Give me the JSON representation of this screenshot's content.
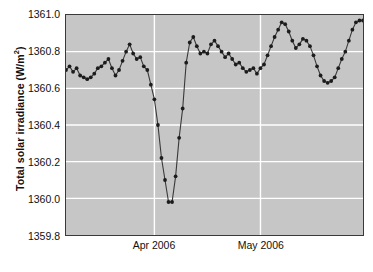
{
  "chart_data": {
    "type": "line",
    "title": "",
    "xlabel": "",
    "ylabel": "Total solar irradiance (W/m²)",
    "ylabel_text": "Total solar irradiance (W/m",
    "ylabel_sup": "2",
    "ylabel_tail": ")",
    "ylim": [
      1359.8,
      1361.0
    ],
    "ytick_values": [
      1361.0,
      1360.8,
      1360.6,
      1360.4,
      1360.2,
      1360.0,
      1359.8
    ],
    "ytick_labels": [
      "1361.0",
      "1360.8",
      "1360.6",
      "1360.4",
      "1360.2",
      "1360.0",
      "1359.8"
    ],
    "xlim_days": [
      0,
      84
    ],
    "xtick_days": [
      25,
      55
    ],
    "xtick_labels": [
      "Apr 2006",
      "May 2006"
    ],
    "grid": {
      "horizontal": true,
      "vertical": true,
      "color": "#ffffff"
    },
    "legend": null,
    "marker": "circle",
    "line_color": "#383838",
    "marker_color": "#1c1c1c",
    "plot_background": "#c6c6c6",
    "frame_color": "#3a3a3a",
    "x": [
      0,
      1,
      2,
      3,
      4,
      5,
      6,
      7,
      8,
      9,
      10,
      11,
      12,
      13,
      14,
      15,
      16,
      17,
      18,
      19,
      20,
      21,
      22,
      23,
      24,
      25,
      26,
      27,
      28,
      29,
      30,
      31,
      32,
      33,
      34,
      35,
      36,
      37,
      38,
      39,
      40,
      41,
      42,
      43,
      44,
      45,
      46,
      47,
      48,
      49,
      50,
      51,
      52,
      53,
      54,
      55,
      56,
      57,
      58,
      59,
      60,
      61,
      62,
      63,
      64,
      65,
      66,
      67,
      68,
      69,
      70,
      71,
      72,
      73,
      74,
      75,
      76,
      77,
      78,
      79,
      80,
      81,
      82,
      83,
      84
    ],
    "values": [
      1360.7,
      1360.72,
      1360.69,
      1360.71,
      1360.67,
      1360.66,
      1360.65,
      1360.66,
      1360.68,
      1360.71,
      1360.72,
      1360.74,
      1360.76,
      1360.71,
      1360.67,
      1360.7,
      1360.75,
      1360.8,
      1360.84,
      1360.79,
      1360.76,
      1360.77,
      1360.72,
      1360.7,
      1360.62,
      1360.54,
      1360.4,
      1360.22,
      1360.1,
      1359.98,
      1359.98,
      1360.12,
      1360.33,
      1360.49,
      1360.74,
      1360.85,
      1360.88,
      1360.83,
      1360.79,
      1360.8,
      1360.79,
      1360.84,
      1360.86,
      1360.83,
      1360.8,
      1360.77,
      1360.79,
      1360.76,
      1360.73,
      1360.74,
      1360.71,
      1360.69,
      1360.7,
      1360.71,
      1360.68,
      1360.71,
      1360.73,
      1360.78,
      1360.83,
      1360.88,
      1360.92,
      1360.96,
      1360.95,
      1360.91,
      1360.86,
      1360.82,
      1360.84,
      1360.87,
      1360.86,
      1360.83,
      1360.78,
      1360.72,
      1360.67,
      1360.64,
      1360.63,
      1360.64,
      1360.66,
      1360.71,
      1360.76,
      1360.8,
      1360.86,
      1360.92,
      1360.96,
      1360.97,
      1360.97
    ]
  }
}
